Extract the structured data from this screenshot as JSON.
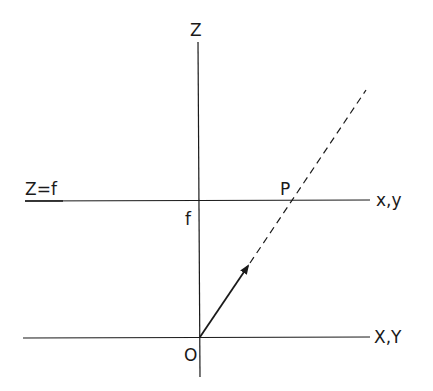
{
  "diagram": {
    "colors": {
      "line": "#1a1a1a",
      "background": "#ffffff"
    },
    "labels": {
      "z_axis": "Z",
      "image_plane": "Z=f",
      "focal_length": "f",
      "point": "P",
      "image_plane_axes": "x,y",
      "world_axes": "X,Y",
      "origin": "O"
    },
    "elements": {
      "z_axis": {
        "x1": 198,
        "y1": 42,
        "x2": 200,
        "y2": 377
      },
      "image_plane_line": {
        "x1": 25,
        "y1": 201,
        "x2": 370,
        "y2": 200
      },
      "world_plane_line": {
        "x1": 23,
        "y1": 338,
        "x2": 370,
        "y2": 337
      },
      "ray_arrow": {
        "x1": 200,
        "y1": 337,
        "x2": 248,
        "y2": 266
      },
      "ray_dashed": {
        "x1": 250,
        "y1": 263,
        "x2": 366,
        "y2": 90
      }
    }
  }
}
